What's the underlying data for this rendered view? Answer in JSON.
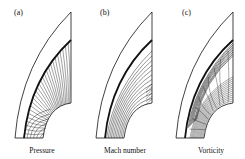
{
  "figure": {
    "panels": [
      {
        "id": "a",
        "label": "(a)",
        "caption": "Pressure",
        "tip_x": 71,
        "left_x": 15,
        "label_x": 14,
        "caption_x": 42,
        "contour_style": "radial"
      },
      {
        "id": "b",
        "label": "(b)",
        "caption": "Mach number",
        "tip_x": 152,
        "left_x": 96,
        "label_x": 100,
        "caption_x": 125,
        "contour_style": "arcs"
      },
      {
        "id": "c",
        "label": "(c)",
        "caption": "Vorticity",
        "tip_x": 233,
        "left_x": 176,
        "label_x": 182,
        "caption_x": 211,
        "contour_style": "wavy"
      }
    ],
    "colors": {
      "line": "#111111",
      "background": "#ffffff"
    }
  }
}
